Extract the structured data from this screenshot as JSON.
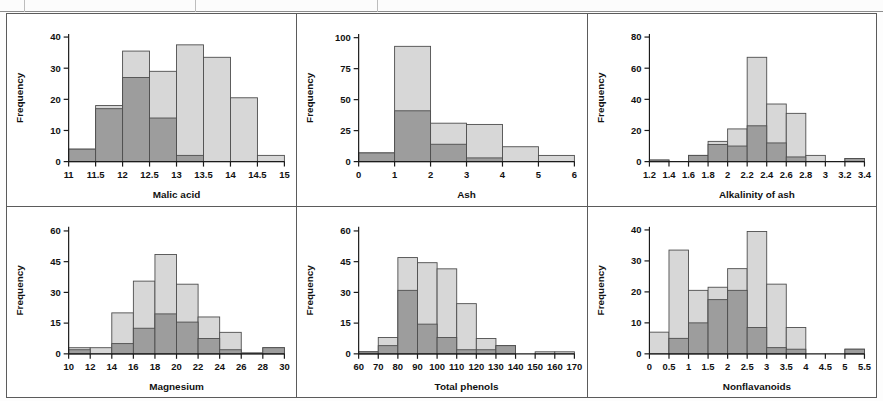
{
  "page": {
    "panel_count": 6,
    "colors": {
      "light_series": "#d7d7d7",
      "dark_series": "#9d9d9d",
      "bar_outline": "#4d4d4d",
      "axis": "#1b1b1b",
      "panel_border": "#5b5b5b",
      "background": "#ffffff"
    }
  },
  "top_strip": {
    "present": true,
    "description": "clipped partial table row at top of scan",
    "segment_ends": [
      25,
      196,
      378,
      940,
      1044
    ]
  },
  "chart_data": [
    {
      "type": "bar",
      "title": "",
      "xlabel": "Malic acid",
      "ylabel": "Frequency",
      "xticks": [
        "11",
        "11.5",
        "12",
        "12.5",
        "13",
        "13.5",
        "14",
        "14.5",
        "15"
      ],
      "xlim": [
        11,
        15
      ],
      "yticks": [
        0,
        10,
        20,
        30,
        40
      ],
      "ylim": [
        0,
        41
      ],
      "grid": false,
      "legend": "none",
      "bin_edges": [
        11,
        11.5,
        12,
        12.5,
        13,
        13.5,
        14,
        14.5,
        15
      ],
      "series": [
        {
          "name": "total",
          "style": "light",
          "values": [
            4,
            18,
            35.5,
            29,
            37.5,
            33.5,
            20.5,
            2
          ]
        },
        {
          "name": "subset",
          "style": "dark",
          "values": [
            4,
            17,
            27,
            14,
            2,
            0,
            0,
            0
          ]
        }
      ]
    },
    {
      "type": "bar",
      "title": "",
      "xlabel": "Ash",
      "ylabel": "Frequency",
      "xticks": [
        "0",
        "1",
        "2",
        "3",
        "4",
        "5",
        "6"
      ],
      "xlim": [
        0,
        6
      ],
      "yticks": [
        0,
        25,
        50,
        75,
        100
      ],
      "ylim": [
        0,
        103
      ],
      "grid": false,
      "legend": "none",
      "bin_edges": [
        0,
        1,
        2,
        3,
        4,
        5,
        6
      ],
      "series": [
        {
          "name": "total",
          "style": "light",
          "values": [
            7,
            93,
            31,
            30,
            12,
            5
          ]
        },
        {
          "name": "subset",
          "style": "dark",
          "values": [
            7,
            41,
            14,
            3,
            0,
            0
          ]
        }
      ]
    },
    {
      "type": "bar",
      "title": "",
      "xlabel": "Alkalinity of ash",
      "ylabel": "Frequency",
      "xticks": [
        "1.2",
        "1.4",
        "1.6",
        "1.8",
        "2",
        "2.2",
        "2.4",
        "2.6",
        "2.8",
        "3",
        "3.2",
        "3.4"
      ],
      "xlim": [
        1.2,
        3.4
      ],
      "yticks": [
        0,
        20,
        40,
        60,
        80
      ],
      "ylim": [
        0,
        82
      ],
      "grid": false,
      "legend": "none",
      "bin_edges": [
        1.2,
        1.4,
        1.6,
        1.8,
        2.0,
        2.2,
        2.4,
        2.6,
        2.8,
        3.0,
        3.2,
        3.4
      ],
      "series": [
        {
          "name": "total",
          "style": "light",
          "values": [
            1,
            0,
            4,
            13,
            21,
            67,
            37,
            31,
            4,
            0,
            2
          ]
        },
        {
          "name": "subset",
          "style": "dark",
          "values": [
            1,
            0,
            4,
            11,
            10,
            23,
            12,
            3,
            0,
            0,
            2
          ]
        }
      ]
    },
    {
      "type": "bar",
      "title": "",
      "xlabel": "Magnesium",
      "ylabel": "Frequency",
      "xticks": [
        "10",
        "12",
        "14",
        "16",
        "18",
        "20",
        "22",
        "24",
        "26",
        "28",
        "30"
      ],
      "xlim": [
        10,
        30
      ],
      "yticks": [
        0,
        15,
        30,
        45,
        60
      ],
      "ylim": [
        0,
        62
      ],
      "grid": false,
      "legend": "none",
      "bin_edges": [
        10,
        12,
        14,
        16,
        18,
        20,
        22,
        24,
        26,
        28,
        30
      ],
      "series": [
        {
          "name": "total",
          "style": "light",
          "values": [
            3,
            3,
            20,
            35.5,
            48.5,
            34,
            18,
            10.5,
            0.5,
            3
          ]
        },
        {
          "name": "subset",
          "style": "dark",
          "values": [
            2,
            0,
            5,
            12.5,
            19.5,
            15.5,
            7.5,
            2,
            0,
            3
          ]
        }
      ]
    },
    {
      "type": "bar",
      "title": "",
      "xlabel": "Total phenols",
      "ylabel": "Frequency",
      "xticks": [
        "60",
        "70",
        "80",
        "90",
        "100",
        "110",
        "120",
        "130",
        "140",
        "150",
        "160",
        "170"
      ],
      "xlim": [
        60,
        170
      ],
      "yticks": [
        0,
        15,
        30,
        45,
        60
      ],
      "ylim": [
        0,
        62
      ],
      "grid": false,
      "legend": "none",
      "bin_edges": [
        60,
        70,
        80,
        90,
        100,
        110,
        120,
        130,
        140,
        150,
        160,
        170
      ],
      "series": [
        {
          "name": "total",
          "style": "light",
          "values": [
            1,
            8,
            47,
            44.5,
            41.5,
            24.5,
            7.5,
            4,
            0,
            1,
            1
          ]
        },
        {
          "name": "subset",
          "style": "dark",
          "values": [
            1,
            4,
            31,
            14.5,
            8,
            2,
            2,
            4,
            0,
            0,
            0
          ]
        }
      ]
    },
    {
      "type": "bar",
      "title": "",
      "xlabel": "Nonflavanoids",
      "ylabel": "Frequency",
      "xticks": [
        "0",
        "0.5",
        "1",
        "1.5",
        "2",
        "2.5",
        "3",
        "3.5",
        "4",
        "4.5",
        "5",
        "5.5"
      ],
      "xlim": [
        0,
        5.5
      ],
      "yticks": [
        0,
        10,
        20,
        30,
        40
      ],
      "ylim": [
        0,
        41
      ],
      "grid": false,
      "legend": "none",
      "bin_edges": [
        0,
        0.5,
        1.0,
        1.5,
        2.0,
        2.5,
        3.0,
        3.5,
        4.0,
        4.5,
        5.0,
        5.5
      ],
      "series": [
        {
          "name": "total",
          "style": "light",
          "values": [
            7,
            33.5,
            20.5,
            21.5,
            27.5,
            39.5,
            22.5,
            8.5,
            0,
            0,
            1.5
          ]
        },
        {
          "name": "subset",
          "style": "dark",
          "values": [
            0,
            5,
            10,
            17.5,
            20.5,
            8.5,
            2,
            1.5,
            0,
            0,
            1.5
          ]
        }
      ]
    }
  ]
}
